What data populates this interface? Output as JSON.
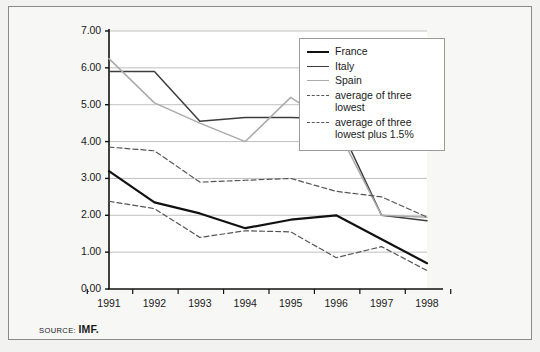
{
  "figure": {
    "source_prefix": "SOURCE:",
    "source_value": "IMF."
  },
  "legend": {
    "items": [
      {
        "label": "France",
        "style": "solid-thick",
        "color": "#111111"
      },
      {
        "label": "Italy",
        "style": "solid-medium",
        "color": "#3d3d3d"
      },
      {
        "label": "Spain",
        "style": "solid-thin",
        "color": "#aaaaaa"
      },
      {
        "label": "average of three lowest",
        "style": "dashed",
        "color": "#555555"
      },
      {
        "label": "average of three lowest plus 1.5%",
        "style": "dashed",
        "color": "#555555"
      }
    ]
  },
  "chart_data": {
    "type": "line",
    "title": "",
    "xlabel": "",
    "ylabel": "",
    "categories": [
      "1991",
      "1992",
      "1993",
      "1994",
      "1995",
      "1996",
      "1997",
      "1998"
    ],
    "ylim": [
      0.0,
      7.0
    ],
    "yticks": [
      "0.00",
      "1.00",
      "2.00",
      "3.00",
      "4.00",
      "5.00",
      "6.00",
      "7.00"
    ],
    "ytick_values": [
      0,
      1,
      2,
      3,
      4,
      5,
      6,
      7
    ],
    "grid": "horizontal",
    "legend_position": "top-right-inside",
    "series": [
      {
        "name": "France",
        "color": "#111111",
        "width": 2.2,
        "dash": "none",
        "values": [
          3.2,
          2.35,
          2.05,
          1.65,
          1.88,
          2.0,
          1.35,
          0.7
        ]
      },
      {
        "name": "Italy",
        "color": "#3d3d3d",
        "width": 1.5,
        "dash": "none",
        "values": [
          5.9,
          5.9,
          4.55,
          4.65,
          4.65,
          4.62,
          2.0,
          1.85
        ]
      },
      {
        "name": "Spain",
        "color": "#aaaaaa",
        "width": 1.5,
        "dash": "none",
        "values": [
          6.25,
          5.05,
          4.5,
          4.0,
          5.2,
          4.4,
          2.0,
          1.95
        ]
      },
      {
        "name": "average of three lowest",
        "color": "#555555",
        "width": 1.2,
        "dash": "5,3",
        "values": [
          2.38,
          2.18,
          1.4,
          1.58,
          1.55,
          0.85,
          1.15,
          0.5
        ]
      },
      {
        "name": "average of three lowest plus 1.5%",
        "color": "#555555",
        "width": 1.2,
        "dash": "5,3",
        "values": [
          3.85,
          3.75,
          2.9,
          2.95,
          3.0,
          2.65,
          2.5,
          1.95
        ]
      }
    ]
  }
}
